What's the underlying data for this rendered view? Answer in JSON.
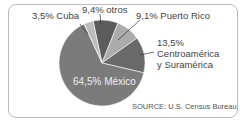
{
  "chart_data": {
    "type": "pie",
    "title": "",
    "categories": [
      "México",
      "Centroamérica y Suramérica",
      "Puerto Rico",
      "otros",
      "Cuba"
    ],
    "values": [
      64.5,
      13.5,
      9.1,
      9.4,
      3.5
    ],
    "colors": [
      "#7b7b7b",
      "#696969",
      "#ababab",
      "#5c5c5c",
      "#bdbdbd"
    ],
    "labels": {
      "mexico": "64,5% México",
      "centro_pct": "13,5%",
      "centro_line1": "Centroamérica",
      "centro_line2": "y Suramérica",
      "puerto_rico": "9,1% Puerto Rico",
      "otros": "9,4% otros",
      "cuba": "3,5% Cuba"
    },
    "source": "SOURCE: U.S. Census Bureau",
    "legend": "none"
  }
}
